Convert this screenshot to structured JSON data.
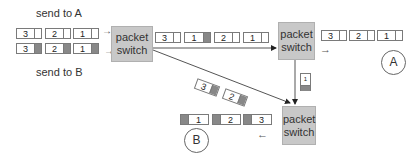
{
  "labels": {
    "send_to_a": "send to A",
    "send_to_b": "send to B"
  },
  "switches": [
    {
      "id": "switch-1",
      "label_line1": "packet",
      "label_line2": "switch"
    },
    {
      "id": "switch-2",
      "label_line1": "packet",
      "label_line2": "switch"
    },
    {
      "id": "switch-3",
      "label_line1": "packet",
      "label_line2": "switch"
    }
  ],
  "hosts": {
    "a": "A",
    "b": "B"
  },
  "queues": {
    "input_a": [
      "3",
      "2",
      "1"
    ],
    "input_b": [
      "3",
      "2",
      "1"
    ],
    "link_top": [
      {
        "num": "3",
        "dest": "A"
      },
      {
        "num": "1",
        "dest": "B"
      },
      {
        "num": "2",
        "dest": "A"
      },
      {
        "num": "1",
        "dest": "A"
      }
    ],
    "diagonal": [
      "3",
      "2"
    ],
    "vertical": [
      "1"
    ],
    "output_a": [
      "3",
      "2",
      "1"
    ],
    "output_b": [
      "1",
      "2",
      "3"
    ]
  },
  "arrows": {
    "small_arrow": "→",
    "left_arrow": "←"
  },
  "colors": {
    "switch_fill": "#c8c8c8",
    "dest_b_marker": "#888888",
    "line": "#444444"
  }
}
